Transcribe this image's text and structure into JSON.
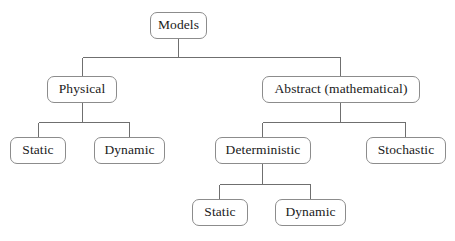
{
  "diagram": {
    "type": "hierarchy-tree",
    "orientation": "top-down",
    "canvas": {
      "width": 455,
      "height": 241,
      "background": "#ffffff"
    },
    "style": {
      "node_border_color": "#8c8c8c",
      "node_fill_color": "#ffffff",
      "node_text_color": "#1a1a1a",
      "connector_color": "#6f6f6f",
      "node_corner_radius": 7
    },
    "nodes": [
      {
        "id": "models",
        "label": "Models",
        "level": 0,
        "x": 150,
        "y": 12,
        "w": 57,
        "h": 27
      },
      {
        "id": "physical",
        "label": "Physical",
        "level": 1,
        "x": 47,
        "y": 76,
        "w": 70,
        "h": 27
      },
      {
        "id": "abstract",
        "label": "Abstract (mathematical)",
        "level": 1,
        "x": 262,
        "y": 76,
        "w": 158,
        "h": 27
      },
      {
        "id": "phys-static",
        "label": "Static",
        "level": 2,
        "x": 10,
        "y": 137,
        "w": 56,
        "h": 27
      },
      {
        "id": "phys-dynamic",
        "label": "Dynamic",
        "level": 2,
        "x": 94,
        "y": 137,
        "w": 71,
        "h": 27
      },
      {
        "id": "deterministic",
        "label": "Deterministic",
        "level": 2,
        "x": 215,
        "y": 137,
        "w": 96,
        "h": 27
      },
      {
        "id": "stochastic",
        "label": "Stochastic",
        "level": 2,
        "x": 366,
        "y": 137,
        "w": 80,
        "h": 27
      },
      {
        "id": "det-static",
        "label": "Static",
        "level": 3,
        "x": 192,
        "y": 199,
        "w": 56,
        "h": 27
      },
      {
        "id": "det-dynamic",
        "label": "Dynamic",
        "level": 3,
        "x": 275,
        "y": 199,
        "w": 71,
        "h": 27
      }
    ],
    "edges": [
      {
        "from": "models",
        "to": "physical"
      },
      {
        "from": "models",
        "to": "abstract"
      },
      {
        "from": "physical",
        "to": "phys-static"
      },
      {
        "from": "physical",
        "to": "phys-dynamic"
      },
      {
        "from": "abstract",
        "to": "deterministic"
      },
      {
        "from": "abstract",
        "to": "stochastic"
      },
      {
        "from": "deterministic",
        "to": "det-static"
      },
      {
        "from": "deterministic",
        "to": "det-dynamic"
      }
    ]
  },
  "labels": {
    "models": "Models",
    "physical": "Physical",
    "abstract": "Abstract (mathematical)",
    "physical_static": "Static",
    "physical_dynamic": "Dynamic",
    "deterministic": "Deterministic",
    "stochastic": "Stochastic",
    "deterministic_static": "Static",
    "deterministic_dynamic": "Dynamic"
  }
}
